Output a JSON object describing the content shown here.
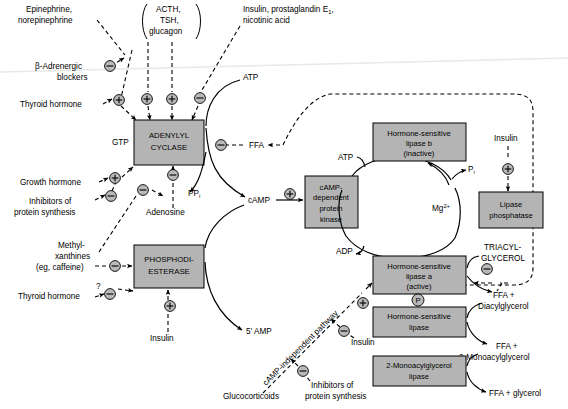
{
  "colors": {
    "box_fill": "#b4b4b4",
    "box_stroke": "#000000",
    "symbol_fill": "#b9b9b9",
    "line": "#000000",
    "background": "#ffffff"
  },
  "enzyme_boxes": {
    "adenylyl_cyclase": "ADENYLYL\nCYCLASE",
    "adenylyl_cyclase_line1": "ADENYLYL",
    "adenylyl_cyclase_line2": "CYCLASE",
    "phosphodiesterase_line1": "PHOSPHODI-",
    "phosphodiesterase_line2": "ESTERASE",
    "camp_kinase_line1": "cAMP-",
    "camp_kinase_line2": "dependent",
    "camp_kinase_line3": "protein",
    "camp_kinase_line4": "kinase",
    "hsl_b_line1": "Hormone-sensitive",
    "hsl_b_line2": "lipase b",
    "hsl_b_line3": "(inactive)",
    "hsl_a_line1": "Hormone-sensitive",
    "hsl_a_line2": "lipase a",
    "hsl_a_line3": "(active)",
    "lipase_phosphatase_line1": "Lipase",
    "lipase_phosphatase_line2": "phosphatase",
    "hsl_plain_line1": "Hormone-sensitive",
    "hsl_plain_line2": "lipase",
    "monoacylglycerol_lipase_line1": "2-Monoacylglycerol",
    "monoacylglycerol_lipase_line2": "lipase"
  },
  "regulators": {
    "epinephrine_line1": "Epinephrine,",
    "epinephrine_line2": "norepinephrine",
    "acth_line1": "ACTH,",
    "acth_line2": "TSH,",
    "acth_line3": "glucagon",
    "insulin_prostaglandin_line1": "Insulin, prostaglandin E",
    "insulin_prostaglandin_sub": "1",
    "insulin_prostaglandin_line1_end": ",",
    "insulin_prostaglandin_line2": "nicotinic acid",
    "beta_blockers_line1": "β-Adrenergic",
    "beta_blockers_line2": "blockers",
    "thyroid_hormone_top": "Thyroid hormone",
    "growth_hormone": "Growth hormone",
    "inhibitors_top_line1": "Inhibitors of",
    "inhibitors_top_line2": "protein synthesis",
    "adenosine": "Adenosine",
    "methylxanthines_line1": "Methyl-",
    "methylxanthines_line2": "xanthines",
    "methylxanthines_line3": "(eg, caffeine)",
    "thyroid_hormone_bottom": "Thyroid hormone",
    "insulin_pde": "Insulin",
    "insulin_phosphatase": "Insulin",
    "insulin_camp_indep": "Insulin",
    "glucocorticoids": "Glucocorticoids",
    "inhibitors_bottom_line1": "Inhibitors of",
    "inhibitors_bottom_line2": "protein synthesis",
    "question_mark": "?"
  },
  "metabolites": {
    "gtp": "GTP",
    "atp_top": "ATP",
    "atp_cycle": "ATP",
    "adp_cycle": "ADP",
    "ffa": "FFA",
    "ppi_base": "PP",
    "ppi_sub": "i",
    "camp": "cAMP",
    "amp5": "5' AMP",
    "pi_base": "P",
    "pi_sub": "i",
    "mg_base": "Mg",
    "mg_sup": "2+",
    "triacylglycerol_line1": "TRIACYL-",
    "triacylglycerol_line2": "GLYCEROL",
    "ffa_diacylglycerol_line1": "FFA +",
    "ffa_diacylglycerol_line2": "Diacylglycerol",
    "ffa_monoacylglycerol_line1": "FFA +",
    "ffa_monoacylglycerol_line2": "2-Monoacylglycerol",
    "ffa_glycerol": "FFA + glycerol",
    "phospho_p": "P"
  },
  "pathway_labels": {
    "camp_independent": "cAMP-independent pathway"
  },
  "symbols": {
    "plus": "+",
    "minus": "−",
    "plus_name": "activation-symbol",
    "minus_name": "inhibition-symbol"
  }
}
